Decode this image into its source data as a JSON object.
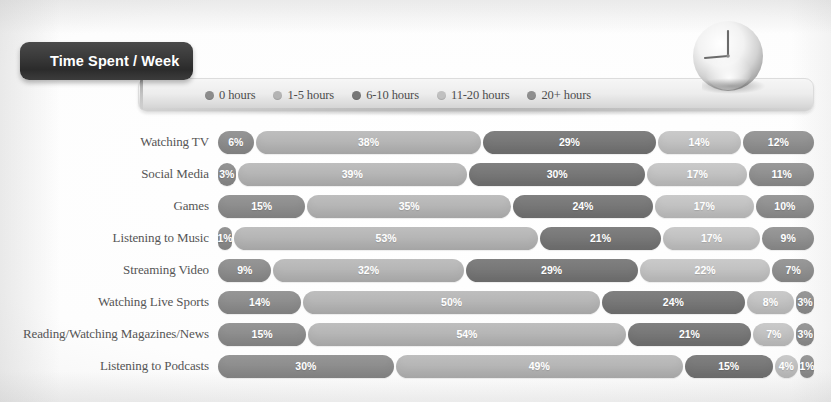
{
  "title": {
    "text": "Time Spent / Week"
  },
  "icons": {
    "clock": "clock-icon"
  },
  "legend": {
    "items": [
      {
        "label": "0 hours",
        "color": "#8c8c8c"
      },
      {
        "label": "1-5 hours",
        "color": "#b4b4b4"
      },
      {
        "label": "6-10 hours",
        "color": "#767676"
      },
      {
        "label": "11-20 hours",
        "color": "#c0c0c0"
      },
      {
        "label": "20+ hours",
        "color": "#8f8f8f"
      }
    ]
  },
  "chart_data": {
    "type": "bar",
    "title": "Time Spent / Week",
    "xlabel": "",
    "ylabel": "",
    "stacked": true,
    "orientation": "horizontal",
    "xlim": [
      0,
      100
    ],
    "grid": false,
    "legend_position": "top",
    "categories": [
      "Watching TV",
      "Social Media",
      "Games",
      "Listening to Music",
      "Streaming Video",
      "Watching Live Sports",
      "Reading/Watching Magazines/News",
      "Listening to Podcasts"
    ],
    "series": [
      {
        "name": "0 hours",
        "color": "#8c8c8c",
        "values": [
          6,
          3,
          15,
          1,
          9,
          14,
          15,
          30
        ]
      },
      {
        "name": "1-5 hours",
        "color": "#b4b4b4",
        "values": [
          38,
          39,
          35,
          53,
          32,
          50,
          54,
          49
        ]
      },
      {
        "name": "6-10 hours",
        "color": "#767676",
        "values": [
          29,
          30,
          24,
          21,
          29,
          24,
          21,
          15
        ]
      },
      {
        "name": "11-20 hours",
        "color": "#c0c0c0",
        "values": [
          14,
          17,
          17,
          17,
          22,
          8,
          7,
          4
        ]
      },
      {
        "name": "20+ hours",
        "color": "#8f8f8f",
        "values": [
          12,
          11,
          10,
          9,
          7,
          3,
          3,
          1
        ]
      }
    ],
    "rows": [
      {
        "label": "Watching TV",
        "segments": [
          {
            "value": "6%",
            "pct": 6
          },
          {
            "value": "38%",
            "pct": 38
          },
          {
            "value": "29%",
            "pct": 29
          },
          {
            "value": "14%",
            "pct": 14
          },
          {
            "value": "12%",
            "pct": 12
          }
        ]
      },
      {
        "label": "Social Media",
        "segments": [
          {
            "value": "3%",
            "pct": 3
          },
          {
            "value": "39%",
            "pct": 39
          },
          {
            "value": "30%",
            "pct": 30
          },
          {
            "value": "17%",
            "pct": 17
          },
          {
            "value": "11%",
            "pct": 11
          }
        ]
      },
      {
        "label": "Games",
        "segments": [
          {
            "value": "15%",
            "pct": 15
          },
          {
            "value": "35%",
            "pct": 35
          },
          {
            "value": "24%",
            "pct": 24
          },
          {
            "value": "17%",
            "pct": 17
          },
          {
            "value": "10%",
            "pct": 10
          }
        ]
      },
      {
        "label": "Listening to Music",
        "segments": [
          {
            "value": "1%",
            "pct": 1
          },
          {
            "value": "53%",
            "pct": 53
          },
          {
            "value": "21%",
            "pct": 21
          },
          {
            "value": "17%",
            "pct": 17
          },
          {
            "value": "9%",
            "pct": 9
          }
        ]
      },
      {
        "label": "Streaming Video",
        "segments": [
          {
            "value": "9%",
            "pct": 9
          },
          {
            "value": "32%",
            "pct": 32
          },
          {
            "value": "29%",
            "pct": 29
          },
          {
            "value": "22%",
            "pct": 22
          },
          {
            "value": "7%",
            "pct": 7
          }
        ]
      },
      {
        "label": "Watching Live Sports",
        "segments": [
          {
            "value": "14%",
            "pct": 14
          },
          {
            "value": "50%",
            "pct": 50
          },
          {
            "value": "24%",
            "pct": 24
          },
          {
            "value": "8%",
            "pct": 8
          },
          {
            "value": "3%",
            "pct": 3
          }
        ]
      },
      {
        "label": "Reading/Watching Magazines/News",
        "segments": [
          {
            "value": "15%",
            "pct": 15
          },
          {
            "value": "54%",
            "pct": 54
          },
          {
            "value": "21%",
            "pct": 21
          },
          {
            "value": "7%",
            "pct": 7
          },
          {
            "value": "3%",
            "pct": 3
          }
        ]
      },
      {
        "label": "Listening to Podcasts",
        "segments": [
          {
            "value": "30%",
            "pct": 30
          },
          {
            "value": "49%",
            "pct": 49
          },
          {
            "value": "15%",
            "pct": 15
          },
          {
            "value": "4%",
            "pct": 4
          },
          {
            "value": "1%",
            "pct": 1
          }
        ]
      }
    ]
  }
}
